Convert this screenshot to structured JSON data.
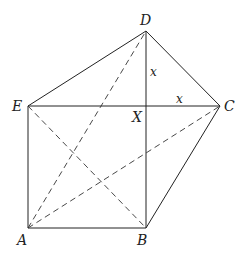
{
  "diagram": {
    "points": {
      "A": {
        "label": "A",
        "x": 28,
        "y": 228
      },
      "B": {
        "label": "B",
        "x": 146,
        "y": 228
      },
      "C": {
        "label": "C",
        "x": 220,
        "y": 106
      },
      "D": {
        "label": "D",
        "x": 146,
        "y": 31
      },
      "E": {
        "label": "E",
        "x": 28,
        "y": 106
      },
      "X": {
        "label": "X",
        "x": 146,
        "y": 106
      }
    },
    "solid_segments": [
      "AB",
      "BC",
      "CD",
      "DE",
      "EA",
      "EC",
      "DB"
    ],
    "dashed_segments": [
      "AD",
      "AC",
      "EB"
    ],
    "segment_labels": [
      {
        "segment": "DX",
        "text": "x"
      },
      {
        "segment": "XC",
        "text": "x"
      }
    ]
  }
}
